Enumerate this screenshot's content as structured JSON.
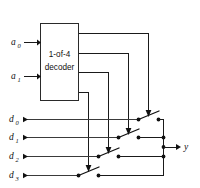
{
  "figure": {
    "decoder": {
      "line1": "1-of-4",
      "line2": "decoder"
    },
    "address_inputs": [
      {
        "name": "a0",
        "base": "a",
        "sub": "0"
      },
      {
        "name": "a1",
        "base": "a",
        "sub": "1"
      }
    ],
    "data_inputs": [
      {
        "name": "d0",
        "base": "d",
        "sub": "0"
      },
      {
        "name": "d1",
        "base": "d",
        "sub": "1"
      },
      {
        "name": "d2",
        "base": "d",
        "sub": "2"
      },
      {
        "name": "d3",
        "base": "d",
        "sub": "3"
      }
    ],
    "output": {
      "name": "y",
      "base": "y",
      "sub": ""
    },
    "colors": {
      "wire": "#1a1a1a",
      "data_wire": "#3a3a3a",
      "node": "#111111",
      "box_fill": "#ffffff",
      "box_stroke": "#2a2a2a",
      "background": "#ffffff"
    },
    "switch_count": 4,
    "decoder_output_count": 4
  }
}
